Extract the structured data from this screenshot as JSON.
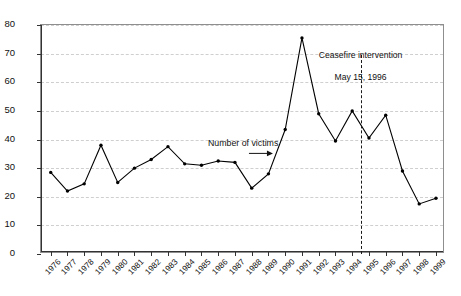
{
  "chart_data": {
    "type": "line",
    "title": "",
    "xlabel": "",
    "ylabel": "",
    "ylim": [
      0,
      80
    ],
    "ytick_step": 10,
    "yticks": [
      0,
      10,
      20,
      30,
      40,
      50,
      60,
      70,
      80
    ],
    "grid": true,
    "grid_style": "dashed horizontal",
    "legend": "none",
    "categories": [
      "1976",
      "1977",
      "1978",
      "1979",
      "1980",
      "1981",
      "1982",
      "1983",
      "1984",
      "1985",
      "1986",
      "1987",
      "1988",
      "1989",
      "1990",
      "1991",
      "1992",
      "1993",
      "1994",
      "1995",
      "1996",
      "1997",
      "1998",
      "1999"
    ],
    "series": [
      {
        "name": "Number of victims",
        "marker": "filled-circle",
        "color": "#000000",
        "values": [
          28.5,
          22,
          24.5,
          38,
          25,
          30,
          33,
          37.5,
          31.5,
          31,
          32.5,
          32,
          23,
          28,
          43.5,
          75.5,
          49,
          39.5,
          50,
          40.5,
          48.5,
          29,
          17.5,
          19.5
        ]
      }
    ],
    "annotations": [
      {
        "name": "ceasefire-annotation",
        "text": "Ceasefire intervention\nMay 15, 1996",
        "marker": "vertical-dashed-line",
        "x_between": [
          "1994",
          "1995"
        ]
      },
      {
        "name": "series-callout",
        "text": "Number of victims",
        "marker": "arrow-right",
        "points_to": "1987"
      }
    ]
  },
  "labels": {
    "series_callout": "Number of victims",
    "ceasefire_line1": "Ceasefire intervention",
    "ceasefire_line2": "May 15, 1996"
  },
  "colors": {
    "line": "#000000",
    "grid": "#cfcfcf",
    "axis": "#333333",
    "plot_border": "#8e8e8e",
    "background": "#ffffff",
    "text": "#111111"
  }
}
